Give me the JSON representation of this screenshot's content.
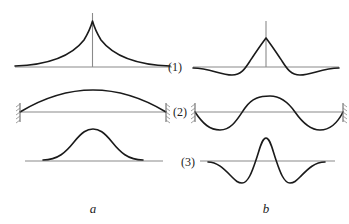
{
  "figure": {
    "rows": [
      {
        "id": "row-1",
        "label": "(1)"
      },
      {
        "id": "row-2",
        "label": "(2)"
      },
      {
        "id": "row-3",
        "label": "(3)"
      }
    ],
    "columns": [
      {
        "id": "col-a",
        "label": "a"
      },
      {
        "id": "col-b",
        "label": "b"
      }
    ],
    "panels": [
      {
        "row": "(1)",
        "column": "a",
        "description": "Symmetric cusp-shaped peak decaying exponentially on both sides, vertical line at the peak"
      },
      {
        "row": "(1)",
        "column": "b",
        "description": "Cusp-shaped peak with negative side lobes on both sides, vertical line at the peak"
      },
      {
        "row": "(2)",
        "column": "a",
        "description": "Single half-sine arch between two clamped (hatched) walls"
      },
      {
        "row": "(2)",
        "column": "b",
        "description": "Full sine-like wave between two clamped (hatched) walls: down, up, down"
      },
      {
        "row": "(3)",
        "column": "a",
        "description": "Gaussian-like bell-shaped pulse above baseline"
      },
      {
        "row": "(3)",
        "column": "b",
        "description": "Mexican-hat-like wavelet: central positive peak with two negative lobes"
      }
    ]
  }
}
